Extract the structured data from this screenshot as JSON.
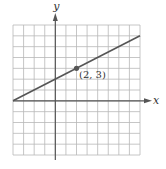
{
  "chart_data": {
    "type": "line",
    "title": "",
    "xlabel": "x",
    "ylabel": "y",
    "xlim": [
      -4,
      8
    ],
    "ylim": [
      -5,
      7
    ],
    "grid": true,
    "grid_step": 1,
    "series": [
      {
        "name": "line",
        "equation": "y = 0.5x + 2",
        "x": [
          -4,
          8
        ],
        "y": [
          0,
          6
        ]
      }
    ],
    "points": [
      {
        "x": 2,
        "y": 3,
        "label": "(2, 3)"
      }
    ]
  },
  "labels": {
    "x_axis": "x",
    "y_axis": "y",
    "point": "(2, 3)"
  },
  "colors": {
    "grid": "#b8b8b8",
    "axis": "#555555",
    "line": "#555555",
    "point": "#555555",
    "text": "#333333"
  }
}
